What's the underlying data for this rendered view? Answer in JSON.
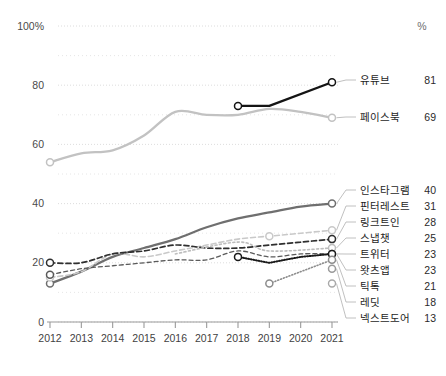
{
  "axes": {
    "y_header": "%",
    "y_ticks": [
      "100%",
      "80",
      "60",
      "40",
      "20",
      "0"
    ],
    "x_ticks": [
      "2012",
      "2013",
      "2014",
      "2015",
      "2016",
      "2017",
      "2018",
      "2019",
      "2020",
      "2021"
    ]
  },
  "legend": [
    {
      "name": "유튜브",
      "value": "81"
    },
    {
      "name": "페이스북",
      "value": "69"
    },
    {
      "name": "인스타그램",
      "value": "40"
    },
    {
      "name": "핀터레스트",
      "value": "31"
    },
    {
      "name": "링크트인",
      "value": "28"
    },
    {
      "name": "스냅챗",
      "value": "25"
    },
    {
      "name": "트위터",
      "value": "23"
    },
    {
      "name": "왓츠앱",
      "value": "23"
    },
    {
      "name": "틱톡",
      "value": "21"
    },
    {
      "name": "레딧",
      "value": "18"
    },
    {
      "name": "넥스트도어",
      "value": "13"
    }
  ],
  "colors": {
    "youtube": "#141414",
    "facebook": "#c2c2c2",
    "instagram": "#6f6f6f",
    "pinterest": "#c9c9c9",
    "linkedin": "#2f2f2f",
    "snapchat": "#bdbdbd",
    "twitter": "#5a5a5a",
    "whatsapp": "#1a1a1a",
    "tiktok": "#8c8c8c",
    "reddit": "#9a9a9a",
    "nextdoor": "#a8a8a8",
    "grid": "#d8d8d8",
    "axis": "#9a9a9a"
  },
  "chart_data": {
    "type": "line",
    "title": "",
    "xlabel": "",
    "ylabel": "%",
    "x": [
      2012,
      2013,
      2014,
      2015,
      2016,
      2017,
      2018,
      2019,
      2020,
      2021
    ],
    "ylim": [
      0,
      100
    ],
    "grid": true,
    "grid_step": 10,
    "legend_position": "right-labels",
    "series": [
      {
        "name": "유튜브",
        "x": [
          2018,
          2019,
          2021
        ],
        "values": [
          73,
          73,
          81
        ],
        "style": "solid",
        "markers": [
          2018,
          2021
        ]
      },
      {
        "name": "페이스북",
        "x": [
          2012,
          2013,
          2014,
          2015,
          2016,
          2017,
          2018,
          2019,
          2020,
          2021
        ],
        "values": [
          54,
          57,
          58,
          63,
          71,
          70,
          70,
          72,
          71,
          69
        ],
        "style": "solid",
        "markers": [
          2012,
          2021
        ]
      },
      {
        "name": "인스타그램",
        "x": [
          2012,
          2013,
          2014,
          2015,
          2016,
          2017,
          2018,
          2019,
          2020,
          2021
        ],
        "values": [
          13,
          17,
          22,
          25,
          28,
          32,
          35,
          37,
          39,
          40
        ],
        "style": "solid",
        "markers": [
          2012,
          2021
        ]
      },
      {
        "name": "핀터레스트",
        "x": [
          2012,
          2013,
          2014,
          2015,
          2016,
          2017,
          2018,
          2019,
          2020,
          2021
        ],
        "values": [
          15,
          17,
          23,
          22,
          24,
          26,
          28,
          29,
          30,
          31
        ],
        "style": "dashed",
        "markers": [
          2012,
          2019,
          2021
        ]
      },
      {
        "name": "링크트인",
        "x": [
          2012,
          2013,
          2014,
          2015,
          2016,
          2017,
          2018,
          2019,
          2020,
          2021
        ],
        "values": [
          20,
          20,
          23,
          24,
          26,
          25,
          25,
          26,
          27,
          28
        ],
        "style": "dashed",
        "markers": [
          2012,
          2021
        ]
      },
      {
        "name": "스냅챗",
        "x": [
          2016,
          2018,
          2019,
          2021
        ],
        "values": [
          23,
          27,
          24,
          25
        ],
        "style": "dashed",
        "markers": [
          2021
        ]
      },
      {
        "name": "트위터",
        "x": [
          2012,
          2013,
          2014,
          2015,
          2016,
          2017,
          2018,
          2019,
          2020,
          2021
        ],
        "values": [
          16,
          18,
          19,
          20,
          21,
          21,
          24,
          22,
          23,
          23
        ],
        "style": "dashed",
        "markers": [
          2012,
          2021
        ]
      },
      {
        "name": "왓츠앱",
        "x": [
          2018,
          2019,
          2020,
          2021
        ],
        "values": [
          22,
          20,
          22,
          23
        ],
        "style": "dotted",
        "markers": [
          2018,
          2021
        ]
      },
      {
        "name": "틱톡",
        "x": [
          2019,
          2021
        ],
        "values": [
          13,
          21
        ],
        "style": "dotted",
        "markers": [
          2019,
          2021
        ]
      },
      {
        "name": "레딧",
        "x": [
          2021
        ],
        "values": [
          18
        ],
        "style": "none",
        "markers": [
          2021
        ]
      },
      {
        "name": "넥스트도어",
        "x": [
          2021
        ],
        "values": [
          13
        ],
        "style": "none",
        "markers": []
      }
    ]
  }
}
